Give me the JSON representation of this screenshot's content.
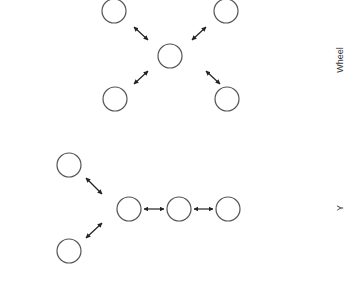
{
  "diagrams": [
    {
      "name": "wheel",
      "label": "Wheel",
      "label_pos": {
        "x": 340,
        "y": 60
      },
      "nodes": [
        {
          "id": "hub",
          "cx": 170,
          "cy": 56
        },
        {
          "id": "tl",
          "cx": 114,
          "cy": 11
        },
        {
          "id": "tr",
          "cx": 226,
          "cy": 11
        },
        {
          "id": "bl",
          "cx": 115,
          "cy": 99
        },
        {
          "id": "br",
          "cx": 227,
          "cy": 99
        }
      ],
      "edges": [
        {
          "x1": 134,
          "y1": 27,
          "x2": 148,
          "y2": 40
        },
        {
          "x1": 206,
          "y1": 27,
          "x2": 192,
          "y2": 40
        },
        {
          "x1": 134,
          "y1": 84,
          "x2": 148,
          "y2": 71
        },
        {
          "x1": 206,
          "y1": 71,
          "x2": 220,
          "y2": 84
        }
      ]
    },
    {
      "name": "y",
      "label": "Y",
      "label_pos": {
        "x": 340,
        "y": 208
      },
      "nodes": [
        {
          "id": "top",
          "cx": 69,
          "cy": 165
        },
        {
          "id": "bottom",
          "cx": 69,
          "cy": 251
        },
        {
          "id": "c1",
          "cx": 129,
          "cy": 209
        },
        {
          "id": "c2",
          "cx": 179,
          "cy": 209
        },
        {
          "id": "c3",
          "cx": 228,
          "cy": 209
        }
      ],
      "edges": [
        {
          "x1": 86,
          "y1": 178,
          "x2": 102,
          "y2": 194
        },
        {
          "x1": 86,
          "y1": 238,
          "x2": 102,
          "y2": 223
        },
        {
          "x1": 144,
          "y1": 209,
          "x2": 164,
          "y2": 209
        },
        {
          "x1": 194,
          "y1": 209,
          "x2": 213,
          "y2": 209
        }
      ]
    }
  ],
  "style": {
    "node_radius": 12,
    "node_stroke": "#555555",
    "edge_color": "#222222"
  }
}
